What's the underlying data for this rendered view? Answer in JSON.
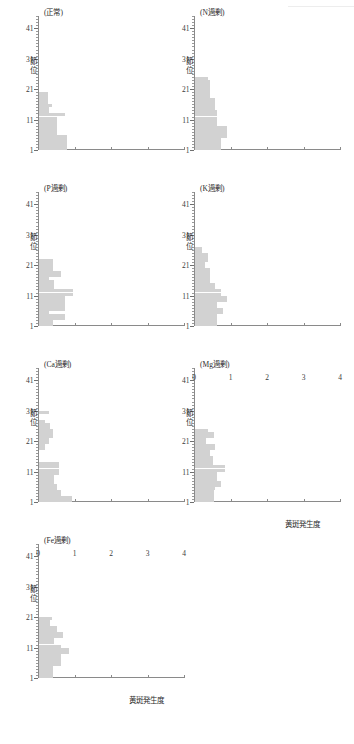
{
  "figure": {
    "axis_titles": {
      "y": "節位",
      "x": "黄斑発生度"
    },
    "y_tick_labels": [
      "1",
      "11",
      "21",
      "31",
      "41"
    ],
    "x_tick_labels": [
      "0",
      "1",
      "2",
      "3",
      "4"
    ],
    "bar_color": "#d2d2d2",
    "axis_color": "#8a8a8a"
  },
  "chart_data": {
    "type": "bar",
    "orientation": "horizontal",
    "title": "",
    "xlabel": "黄斑発生度",
    "ylabel": "節位",
    "xlim": [
      0,
      4
    ],
    "ylim": [
      1,
      45
    ],
    "xticks": [
      0,
      1,
      2,
      3,
      4
    ],
    "yticks": [
      1,
      11,
      21,
      31,
      41
    ],
    "grid": false,
    "legend": "none",
    "panels": [
      {
        "title": "(正常)",
        "treatment": "正常",
        "categories": [
          1,
          2,
          3,
          4,
          5,
          6,
          7,
          8,
          9,
          10,
          11,
          12,
          13,
          14,
          15,
          16,
          17,
          18,
          19
        ],
        "values": [
          0.78,
          0.78,
          0.78,
          0.78,
          0.78,
          0.5,
          0.5,
          0.5,
          0.5,
          0.5,
          0.5,
          0.72,
          0.28,
          0.28,
          0.38,
          0.25,
          0.25,
          0.25,
          0.25
        ]
      },
      {
        "title": "(N過剰)",
        "treatment": "N過剰",
        "categories": [
          1,
          2,
          3,
          4,
          5,
          6,
          7,
          8,
          9,
          10,
          11,
          12,
          13,
          14,
          15,
          16,
          17,
          18,
          19,
          20,
          21,
          22,
          23,
          24
        ],
        "values": [
          0.72,
          0.72,
          0.72,
          0.72,
          0.88,
          0.88,
          0.88,
          0.88,
          0.62,
          0.62,
          0.62,
          0.62,
          0.62,
          0.55,
          0.55,
          0.55,
          0.55,
          0.42,
          0.42,
          0.42,
          0.42,
          0.42,
          0.42,
          0.38
        ]
      },
      {
        "title": "(P過剰)",
        "treatment": "P過剰",
        "categories": [
          1,
          2,
          3,
          4,
          5,
          6,
          7,
          8,
          9,
          10,
          11,
          12,
          13,
          14,
          15,
          16,
          17,
          18,
          19,
          20,
          21,
          22
        ],
        "values": [
          0.4,
          0.4,
          0.72,
          0.72,
          0.28,
          0.72,
          0.72,
          0.72,
          0.72,
          0.72,
          0.95,
          0.95,
          0.42,
          0.42,
          0.42,
          0.28,
          0.62,
          0.62,
          0.4,
          0.4,
          0.4,
          0.4
        ]
      },
      {
        "title": "(K過剰)",
        "treatment": "K過剰",
        "categories": [
          1,
          2,
          3,
          4,
          5,
          6,
          7,
          8,
          9,
          10,
          11,
          12,
          13,
          14,
          15,
          16,
          17,
          18,
          19,
          20,
          21,
          22,
          23,
          24,
          25,
          26
        ],
        "values": [
          0.62,
          0.62,
          0.62,
          0.62,
          0.78,
          0.78,
          0.62,
          0.62,
          0.88,
          0.88,
          0.72,
          0.72,
          0.55,
          0.55,
          0.42,
          0.42,
          0.42,
          0.42,
          0.42,
          0.28,
          0.28,
          0.38,
          0.38,
          0.38,
          0.2,
          0.2
        ]
      },
      {
        "title": "(Ca過剰)",
        "treatment": "Ca過剰",
        "categories": [
          1,
          2,
          3,
          4,
          5,
          6,
          7,
          8,
          9,
          10,
          11,
          12,
          13,
          14,
          15,
          16,
          17,
          18,
          19,
          20,
          21,
          22,
          23,
          24,
          25,
          26,
          27,
          28,
          29,
          30
        ],
        "values": [
          0.92,
          0.92,
          0.62,
          0.62,
          0.5,
          0.5,
          0.42,
          0.42,
          0.42,
          0.55,
          0.55,
          0.55,
          0.55,
          0,
          0,
          0,
          0,
          0.18,
          0.18,
          0.28,
          0.28,
          0.4,
          0.4,
          0.4,
          0.3,
          0.3,
          0.18,
          0,
          0,
          0.28
        ]
      },
      {
        "title": "(Mg過剰)",
        "treatment": "Mg過剰",
        "categories": [
          1,
          2,
          3,
          4,
          5,
          6,
          7,
          8,
          9,
          10,
          11,
          12,
          13,
          14,
          15,
          16,
          17,
          18,
          19,
          20,
          21,
          22,
          23,
          24
        ],
        "values": [
          0.52,
          0.52,
          0.52,
          0.52,
          0.55,
          0.72,
          0.72,
          0.62,
          0.62,
          0.62,
          0.82,
          0.82,
          0.5,
          0.5,
          0.5,
          0.42,
          0.42,
          0.55,
          0.55,
          0.3,
          0.3,
          0.52,
          0.52,
          0.38
        ]
      },
      {
        "title": "(Fe過剰)",
        "treatment": "Fe過剰",
        "categories": [
          1,
          2,
          3,
          4,
          5,
          6,
          7,
          8,
          9,
          10,
          11,
          12,
          13,
          14,
          15,
          16,
          17,
          18,
          19,
          20
        ],
        "values": [
          0.4,
          0.4,
          0.4,
          0.4,
          0.62,
          0.62,
          0.62,
          0.62,
          0.82,
          0.82,
          0.62,
          0.42,
          0.42,
          0.68,
          0.68,
          0.5,
          0.5,
          0.3,
          0.3,
          0.38
        ]
      }
    ]
  }
}
